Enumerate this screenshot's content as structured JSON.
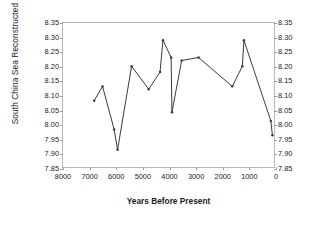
{
  "chart_data": {
    "type": "line",
    "title": "",
    "xlabel": "Years Before Present",
    "ylabel": "South China Sea Reconstructed pH",
    "xlim": [
      8000,
      0
    ],
    "ylim": [
      7.85,
      8.35
    ],
    "x_reversed": true,
    "grid": false,
    "legend": null,
    "xticks": [
      8000,
      7000,
      6000,
      5000,
      4000,
      3000,
      2000,
      1000,
      0
    ],
    "xtick_labels": [
      "8000",
      "7000",
      "6000",
      "5000",
      "4000",
      "3000",
      "2000",
      "1000",
      "0"
    ],
    "yticks": [
      7.85,
      7.9,
      7.95,
      8.0,
      8.05,
      8.1,
      8.15,
      8.2,
      8.25,
      8.3,
      8.35
    ],
    "ytick_labels": [
      "7.85",
      "7.90",
      "7.95",
      "8.00",
      "8.05",
      "8.10",
      "8.15",
      "8.20",
      "8.25",
      "8.30",
      "8.35"
    ],
    "y_axis_right_mirrored": true,
    "series": [
      {
        "name": "South China Sea reconstructed pH",
        "color": "#3a3a3a",
        "marker": "dot",
        "x": [
          6820,
          6500,
          6060,
          5930,
          5400,
          4750,
          4320,
          4210,
          3900,
          3870,
          3500,
          2860,
          1580,
          1200,
          1140,
          120,
          60
        ],
        "y": [
          8.08,
          8.13,
          7.98,
          7.91,
          8.2,
          8.12,
          8.18,
          8.29,
          8.23,
          8.04,
          8.22,
          8.23,
          8.13,
          8.2,
          8.29,
          8.01,
          7.96
        ]
      }
    ]
  },
  "axis": {
    "frame_color": "#b9b9b9",
    "tick_color": "#9a9a9a",
    "text_color": "#1a1a1a"
  }
}
